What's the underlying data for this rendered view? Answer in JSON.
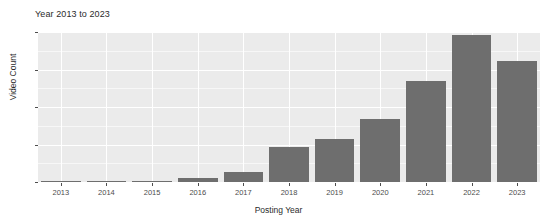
{
  "chart_data": {
    "type": "bar",
    "title": "Year 2013 to 2023",
    "xlabel": "Posting Year",
    "ylabel": "Video Count",
    "categories": [
      "2013",
      "2014",
      "2015",
      "2016",
      "2017",
      "2018",
      "2019",
      "2020",
      "2021",
      "2022",
      "2023"
    ],
    "values": [
      1,
      1,
      2,
      6,
      14,
      47,
      57,
      84,
      135,
      196,
      162
    ],
    "ylim": [
      0,
      200
    ],
    "y_ticks": [
      0,
      50,
      100,
      150,
      200
    ],
    "y_tick_labels": [
      "0",
      "50",
      "100",
      "150",
      "200"
    ],
    "grid": true,
    "legend": "none",
    "bar_color": "#6e6e6e",
    "panel_color": "#ebebeb",
    "gridline_color": "#ffffff"
  }
}
